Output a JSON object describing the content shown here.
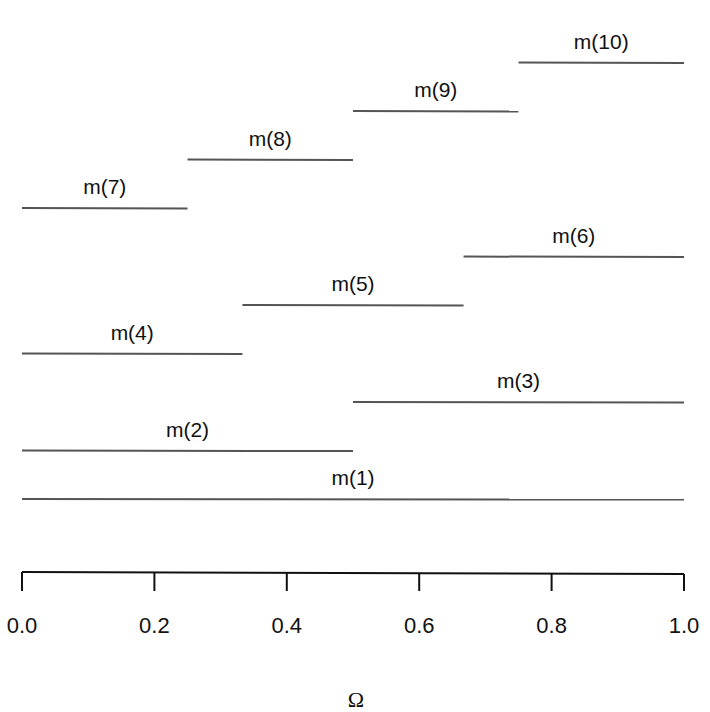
{
  "figure": {
    "xlabel": "Ω",
    "axis": {
      "xlim": [
        0.0,
        1.0
      ],
      "ticks": [
        0.0,
        0.2,
        0.4,
        0.6,
        0.8,
        1.0
      ],
      "tick_labels": [
        "0.0",
        "0.2",
        "0.4",
        "0.6",
        "0.8",
        "1.0"
      ]
    },
    "segments": [
      {
        "label": "m(1)",
        "start": 0.0,
        "end": 1.0,
        "level": 1
      },
      {
        "label": "m(2)",
        "start": 0.0,
        "end": 0.5,
        "level": 2
      },
      {
        "label": "m(3)",
        "start": 0.5,
        "end": 1.0,
        "level": 3
      },
      {
        "label": "m(4)",
        "start": 0.0,
        "end": 0.333,
        "level": 4
      },
      {
        "label": "m(5)",
        "start": 0.333,
        "end": 0.667,
        "level": 5
      },
      {
        "label": "m(6)",
        "start": 0.667,
        "end": 1.0,
        "level": 6
      },
      {
        "label": "m(7)",
        "start": 0.0,
        "end": 0.25,
        "level": 7
      },
      {
        "label": "m(8)",
        "start": 0.25,
        "end": 0.5,
        "level": 8
      },
      {
        "label": "m(9)",
        "start": 0.5,
        "end": 0.75,
        "level": 9
      },
      {
        "label": "m(10)",
        "start": 0.75,
        "end": 1.0,
        "level": 10
      }
    ],
    "colors": {
      "line": "#555555",
      "axis": "#111111",
      "text": "#111111"
    }
  },
  "chart_data": {
    "type": "interval",
    "title": "",
    "xlabel": "Ω",
    "ylabel": "",
    "xlim": [
      0.0,
      1.0
    ],
    "x_ticks": [
      0.0,
      0.2,
      0.4,
      0.6,
      0.8,
      1.0
    ],
    "grid": false,
    "series": [
      {
        "name": "m(1)",
        "x": [
          0.0,
          1.0
        ]
      },
      {
        "name": "m(2)",
        "x": [
          0.0,
          0.5
        ]
      },
      {
        "name": "m(3)",
        "x": [
          0.5,
          1.0
        ]
      },
      {
        "name": "m(4)",
        "x": [
          0.0,
          0.333
        ]
      },
      {
        "name": "m(5)",
        "x": [
          0.333,
          0.667
        ]
      },
      {
        "name": "m(6)",
        "x": [
          0.667,
          1.0
        ]
      },
      {
        "name": "m(7)",
        "x": [
          0.0,
          0.25
        ]
      },
      {
        "name": "m(8)",
        "x": [
          0.25,
          0.5
        ]
      },
      {
        "name": "m(9)",
        "x": [
          0.5,
          0.75
        ]
      },
      {
        "name": "m(10)",
        "x": [
          0.75,
          1.0
        ]
      }
    ]
  }
}
